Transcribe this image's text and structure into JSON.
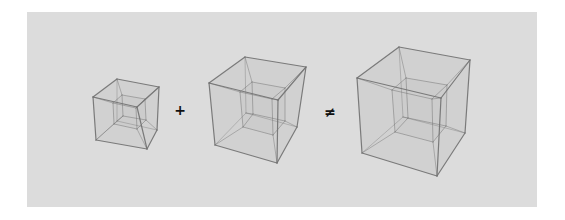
{
  "figure": {
    "background": "#dcdcdc",
    "edge_color": "#707070",
    "face_color": "#bdbdbd",
    "operators": [
      {
        "symbol": "+",
        "x": 180,
        "y": 110
      },
      {
        "symbol": "≠",
        "x": 330,
        "y": 112
      }
    ],
    "cubes": [
      {
        "name": "small-tesseract",
        "outer": {
          "A": [
            117,
            79
          ],
          "B": [
            159,
            87
          ],
          "C": [
            93,
            97
          ],
          "D": [
            137,
            107
          ],
          "E": [
            96,
            140
          ],
          "F": [
            147,
            149
          ],
          "G": [
            157,
            130
          ],
          "H": [
            117,
            121
          ]
        },
        "inner": {
          "A": [
            122,
            95
          ],
          "B": [
            145,
            99
          ],
          "C": [
            113,
            103
          ],
          "D": [
            136,
            108
          ],
          "E": [
            114,
            124
          ],
          "F": [
            137,
            129
          ],
          "G": [
            146,
            120
          ],
          "H": [
            123,
            116
          ]
        }
      },
      {
        "name": "medium-tesseract",
        "outer": {
          "A": [
            245,
            57
          ],
          "B": [
            306,
            67
          ],
          "C": [
            209,
            83
          ],
          "D": [
            278,
            100
          ],
          "E": [
            215,
            145
          ],
          "F": [
            277,
            163
          ],
          "G": [
            297,
            127
          ],
          "H": [
            246,
            113
          ]
        },
        "inner": {
          "A": [
            252,
            82
          ],
          "B": [
            285,
            88
          ],
          "C": [
            240,
            92
          ],
          "D": [
            272,
            99
          ],
          "E": [
            243,
            127
          ],
          "F": [
            273,
            135
          ],
          "G": [
            285,
            121
          ],
          "H": [
            253,
            114
          ]
        }
      },
      {
        "name": "large-tesseract",
        "outer": {
          "A": [
            399,
            47
          ],
          "B": [
            470,
            60
          ],
          "C": [
            357,
            78
          ],
          "D": [
            441,
            98
          ],
          "E": [
            362,
            153
          ],
          "F": [
            437,
            176
          ],
          "G": [
            465,
            133
          ],
          "H": [
            403,
            117
          ]
        },
        "inner": {
          "A": [
            406,
            78
          ],
          "B": [
            447,
            85
          ],
          "C": [
            392,
            90
          ],
          "D": [
            432,
            99
          ],
          "E": [
            395,
            132
          ],
          "F": [
            433,
            142
          ],
          "G": [
            446,
            126
          ],
          "H": [
            408,
            118
          ]
        }
      }
    ]
  }
}
